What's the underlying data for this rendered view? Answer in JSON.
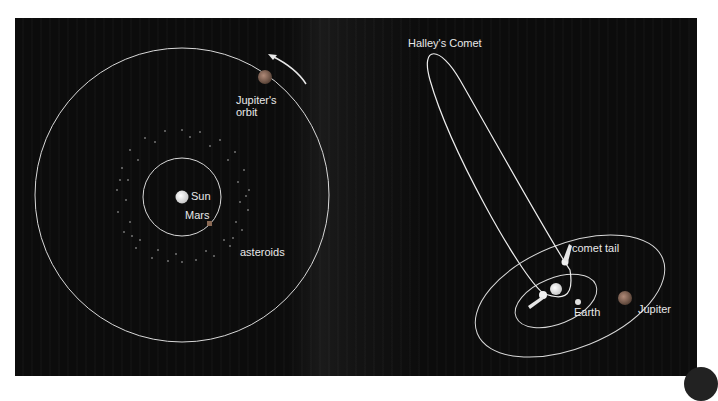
{
  "left_diagram": {
    "labels": {
      "sun": "Sun",
      "mars": "Mars",
      "asteroids": "asteroids",
      "jupiter_orbit": "Jupiter's\norbit"
    }
  },
  "right_diagram": {
    "labels": {
      "comet": "Halley's Comet",
      "comet_tail": "comet tail",
      "earth": "Earth",
      "jupiter": "Jupiter"
    }
  },
  "colors": {
    "background": "#0c0c0c",
    "orbit": "#e0e0e0",
    "sun": "#f4f4f4",
    "mars": "#9a6a50",
    "jupiter": "#8a6a58",
    "label": "#e8e8e8"
  }
}
